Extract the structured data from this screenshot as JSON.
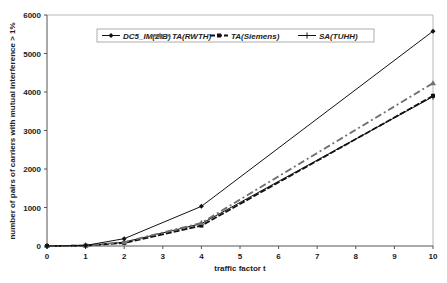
{
  "chart_data": {
    "type": "line",
    "title": "",
    "xlabel": "traffic factor t",
    "ylabel": "number of pairs of carriers with mutual interference > 1%",
    "x": [
      0,
      1,
      2,
      4,
      10
    ],
    "xlim": [
      0,
      10
    ],
    "ylim": [
      0,
      6000
    ],
    "x_ticks": [
      "0",
      "1",
      "2",
      "3",
      "4",
      "5",
      "6",
      "7",
      "8",
      "9",
      "10"
    ],
    "y_ticks": [
      "0",
      "1000",
      "2000",
      "3000",
      "4000",
      "5000",
      "6000"
    ],
    "grid": false,
    "legend_position": "top, inside plot",
    "series": [
      {
        "name": "DC5_IM(ZIB)",
        "values": [
          0,
          15,
          190,
          1030,
          5580
        ],
        "color": "#111111",
        "style": "solid",
        "marker": "diamond"
      },
      {
        "name": "TA(RWTH)",
        "values": [
          0,
          10,
          100,
          600,
          4230
        ],
        "color": "#707070",
        "style": "dash-dot",
        "marker": "triangle"
      },
      {
        "name": "TA(Siemens)",
        "values": [
          0,
          10,
          80,
          530,
          3900
        ],
        "color": "#111111",
        "style": "dashed",
        "marker": "square"
      },
      {
        "name": "SA(TUHH)",
        "values": [
          0,
          10,
          100,
          580,
          3880
        ],
        "color": "#111111",
        "style": "solid",
        "marker": "plus"
      }
    ]
  }
}
